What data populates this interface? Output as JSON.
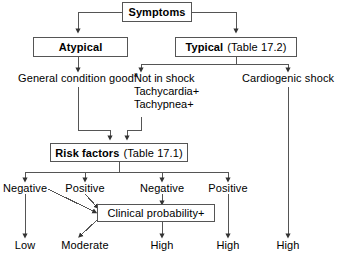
{
  "diagram": {
    "type": "flowchart",
    "background_color": "#ffffff",
    "line_color": "#555555",
    "text_color": "#000000",
    "nodes": {
      "symptoms": {
        "label": "Symptoms",
        "style": "box-bold"
      },
      "atypical": {
        "label": "Atypical",
        "style": "box-bold"
      },
      "typical_bold": {
        "label": "Typical",
        "typical_note": "(Table 17.2)",
        "style": "box-bold-plus-note"
      },
      "general_condition": {
        "label": "General condition good",
        "superscript": "a"
      },
      "not_in_shock": {
        "line1": "Not in shock",
        "line2": "Tachycardia+",
        "line3": "Tachypnea+"
      },
      "cardiogenic_shock": {
        "label": "Cardiogenic shock"
      },
      "risk_factors": {
        "label": "Risk factors",
        "note": "(Table 17.1)",
        "style": "box-bold-plus-note"
      },
      "clinical_probability": {
        "label": "Clinical probability+",
        "style": "box-plain"
      }
    },
    "branch_labels": {
      "negative_left": "Negative",
      "positive_left": "Positive",
      "negative_right": "Negative",
      "positive_right": "Positive"
    },
    "outcomes": {
      "low": "Low",
      "moderate": "Moderate",
      "high_1": "High",
      "high_2": "High",
      "high_3": "High"
    }
  }
}
